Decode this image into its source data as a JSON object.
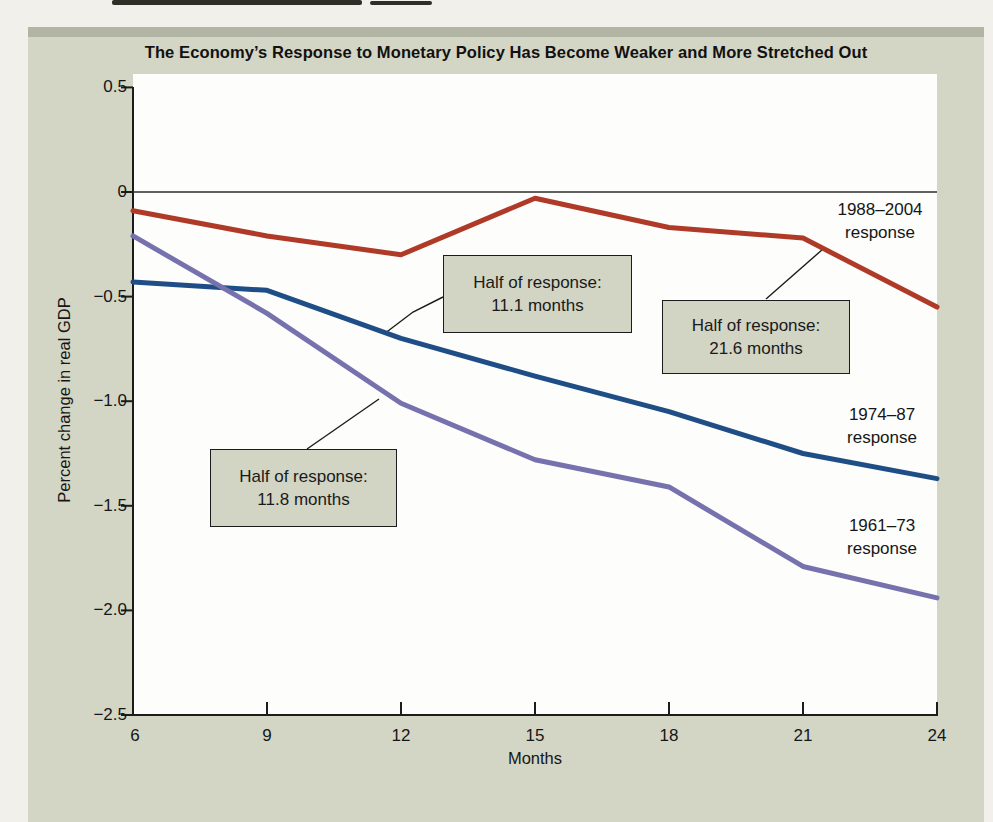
{
  "figure": {
    "title": "The Economy’s Response to Monetary Policy Has Become Weaker and More Stretched Out"
  },
  "chart_data": {
    "type": "line",
    "title": "The Economy’s Response to Monetary Policy Has Become Weaker and More Stretched Out",
    "xlabel": "Months",
    "ylabel": "Percent change in real GDP",
    "x": [
      6,
      9,
      12,
      15,
      18,
      21,
      24
    ],
    "x_tick_labels": [
      "6",
      "9",
      "12",
      "15",
      "18",
      "21",
      "24"
    ],
    "xlim": [
      6,
      24
    ],
    "ylim": [
      -2.5,
      0.5
    ],
    "y_ticks": [
      0.5,
      0,
      -0.5,
      -1.0,
      -1.5,
      -2.0,
      -2.5
    ],
    "y_tick_labels": [
      "0.5",
      "0",
      "−0.5",
      "−1.0",
      "−1.5",
      "−2.0",
      "−2.5"
    ],
    "grid": false,
    "legend_position": "inline-right-of-lines",
    "series": [
      {
        "name": "1988–2004 response",
        "label_line1": "1988–2004",
        "label_line2": "response",
        "color": "#b03a28",
        "values": [
          -0.09,
          -0.21,
          -0.3,
          -0.03,
          -0.17,
          -0.22,
          -0.55
        ]
      },
      {
        "name": "1974–87 response",
        "label_line1": "1974–87",
        "label_line2": "response",
        "color": "#1f4e87",
        "values": [
          -0.43,
          -0.47,
          -0.7,
          -0.88,
          -1.05,
          -1.25,
          -1.37
        ]
      },
      {
        "name": "1961–73 response",
        "label_line1": "1961–73",
        "label_line2": "response",
        "color": "#7672ae",
        "values": [
          -0.21,
          -0.58,
          -1.01,
          -1.28,
          -1.41,
          -1.79,
          -1.94
        ]
      }
    ],
    "annotations": [
      {
        "line1": "Half of response:",
        "line2": "11.1 months",
        "target_series": "1974–87 response"
      },
      {
        "line1": "Half of response:",
        "line2": "21.6 months",
        "target_series": "1988–2004 response"
      },
      {
        "line1": "Half of response:",
        "line2": "11.8 months",
        "target_series": "1961–73 response"
      }
    ]
  },
  "colors": {
    "card_background": "#d3d5c5",
    "card_top_edge": "#b2b5a3",
    "plot_background": "#fdfdfb",
    "axis": "#1c1c1c",
    "series_1988_2004": "#b03a28",
    "series_1974_87": "#1f4e87",
    "series_1961_73": "#7672ae",
    "callout_fill": "#d2d4c4",
    "callout_border": "#1c1c1c"
  }
}
